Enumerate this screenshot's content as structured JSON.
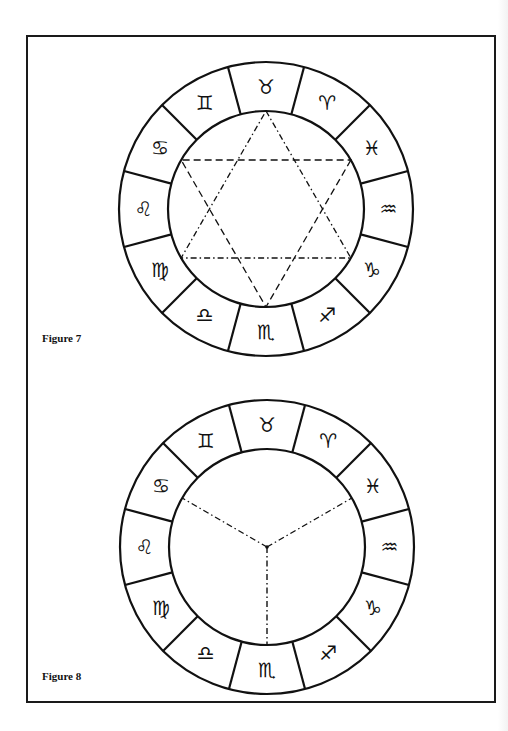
{
  "figures": [
    {
      "id": "figure-7",
      "label": "Figure 7",
      "center": [
        266,
        209
      ],
      "outer_radius": 147,
      "inner_radius": 98,
      "inner_figure": "hexagram (two interlaced dashed triangles)",
      "signs_clockwise_from_top": [
        {
          "name": "Taurus",
          "glyph": "♉"
        },
        {
          "name": "Aries",
          "glyph": "♈"
        },
        {
          "name": "Pisces",
          "glyph": "♓"
        },
        {
          "name": "Aquarius",
          "glyph": "♒"
        },
        {
          "name": "Capricorn",
          "glyph": "♑"
        },
        {
          "name": "Sagittarius",
          "glyph": "♐"
        },
        {
          "name": "Scorpio",
          "glyph": "♏"
        },
        {
          "name": "Libra",
          "glyph": "♎"
        },
        {
          "name": "Virgo",
          "glyph": "♍"
        },
        {
          "name": "Leo",
          "glyph": "♌"
        },
        {
          "name": "Cancer",
          "glyph": "♋"
        },
        {
          "name": "Gemini",
          "glyph": "♊"
        }
      ]
    },
    {
      "id": "figure-8",
      "label": "Figure 8",
      "center": [
        267,
        547
      ],
      "outer_radius": 147,
      "inner_radius": 98,
      "inner_figure": "three dashed radii dividing inner circle into thirds",
      "signs_clockwise_from_top": [
        {
          "name": "Taurus",
          "glyph": "♉"
        },
        {
          "name": "Aries",
          "glyph": "♈"
        },
        {
          "name": "Pisces",
          "glyph": "♓"
        },
        {
          "name": "Aquarius",
          "glyph": "♒"
        },
        {
          "name": "Capricorn",
          "glyph": "♑"
        },
        {
          "name": "Sagittarius",
          "glyph": "♐"
        },
        {
          "name": "Scorpio",
          "glyph": "♏"
        },
        {
          "name": "Libra",
          "glyph": "♎"
        },
        {
          "name": "Virgo",
          "glyph": "♍"
        },
        {
          "name": "Leo",
          "glyph": "♌"
        },
        {
          "name": "Cancer",
          "glyph": "♋"
        },
        {
          "name": "Gemini",
          "glyph": "♊"
        }
      ]
    }
  ],
  "colors": {
    "ink": "#111111",
    "paper": "#ffffff"
  }
}
